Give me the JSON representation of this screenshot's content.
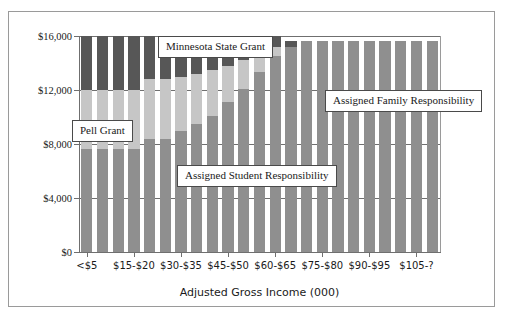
{
  "chart_data": {
    "type": "bar",
    "subtype": "stacked-bar",
    "title": "",
    "xlabel": "Adjusted Gross Income (000)",
    "ylabel": "",
    "ylim": [
      0,
      16000
    ],
    "yticks": [
      0,
      4000,
      8000,
      12000,
      16000
    ],
    "ytick_labels": [
      "$0",
      "$4,000",
      "$8,000",
      "$12,000",
      "$16,000"
    ],
    "grid": true,
    "legend_position": "callouts-inside-plot",
    "bar_count": 23,
    "categories": [
      "<$5",
      "$5-$10",
      "$10-$15",
      "$15-$20",
      "$20-$25",
      "$25-$30",
      "$30-$35",
      "$35-$40",
      "$40-$45",
      "$45-$50",
      "$50-$55",
      "$55-$60",
      "$60-$65",
      "$65-$70",
      "$70-$75",
      "$75-$80",
      "$80-$85",
      "$85-$90",
      "$90-$95",
      "$95-$100",
      "$100-$105",
      "$105-?",
      "$105-?+"
    ],
    "xtick_labels_shown": [
      "<$5",
      "$15-$20",
      "$30-$35",
      "$45-$50",
      "$60-$65",
      "$75-$80",
      "$90-$95",
      "$105-?"
    ],
    "xtick_label_indices": [
      0,
      3,
      6,
      9,
      12,
      15,
      18,
      21
    ],
    "series": [
      {
        "name": "Assigned Student Responsibility",
        "color": "#8f8f8f",
        "values": [
          7600,
          7600,
          7600,
          7600,
          7600,
          7600,
          7600,
          7600,
          7600,
          7600,
          7600,
          7600,
          7600,
          7600,
          7600,
          7600,
          7600,
          7600,
          7600,
          7600,
          7600,
          7600,
          7600
        ]
      },
      {
        "name": "Pell Grant",
        "color": "#c6c6c6",
        "values": [
          4400,
          4400,
          4400,
          4400,
          4400,
          4400,
          4000,
          3700,
          3400,
          2700,
          2100,
          1400,
          700,
          0,
          0,
          0,
          0,
          0,
          0,
          0,
          0,
          0,
          0
        ]
      },
      {
        "name": "Minnesota State Grant",
        "color": "#575757",
        "values": [
          4000,
          4000,
          4000,
          4000,
          3200,
          3200,
          3000,
          2800,
          2500,
          2200,
          1800,
          1300,
          800,
          400,
          0,
          0,
          0,
          0,
          0,
          0,
          0,
          0,
          0
        ]
      },
      {
        "name": "Assigned Family Responsibility",
        "color": "#8f8f8f",
        "values": [
          0,
          0,
          0,
          0,
          800,
          800,
          1400,
          1900,
          2500,
          3500,
          4500,
          5700,
          6900,
          7600,
          8000,
          8000,
          8000,
          8000,
          8000,
          8000,
          8000,
          8000,
          8000
        ]
      }
    ],
    "annotations": [
      {
        "text": "Minnesota State Grant",
        "name": "minnesota-state-grant"
      },
      {
        "text": "Pell Grant",
        "name": "pell-grant"
      },
      {
        "text": "Assigned Family Responsibility",
        "name": "assigned-family-responsibility"
      },
      {
        "text": "Assigned Student Responsibility",
        "name": "assigned-student-responsibility"
      }
    ]
  },
  "labels": {
    "minnesota_state_grant": "Minnesota State Grant",
    "pell_grant": "Pell Grant",
    "assigned_family_responsibility": "Assigned Family Responsibility",
    "assigned_student_responsibility": "Assigned Student Responsibility",
    "x_axis_title": "Adjusted Gross Income (000)"
  },
  "colors": {
    "student": "#8f8f8f",
    "pell": "#c6c6c6",
    "msg": "#575757",
    "family": "#8f8f8f",
    "axis": "#6f6f6f",
    "frame": "#9a9a9a"
  }
}
